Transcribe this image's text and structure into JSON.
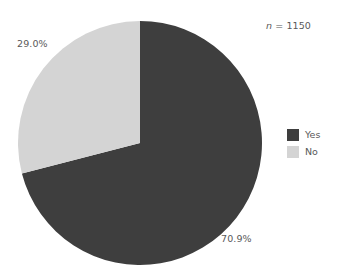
{
  "chart_data": {
    "type": "pie",
    "title": "",
    "categories": [
      "Yes",
      "No"
    ],
    "values": [
      70.9,
      29.0
    ],
    "value_labels": [
      "70.9%",
      "29.0%"
    ],
    "colors": [
      "#3e3e3e",
      "#d4d4d4"
    ],
    "legend": {
      "position": "right",
      "entries": [
        {
          "label": "Yes",
          "color": "#3e3e3e"
        },
        {
          "label": "No",
          "color": "#d4d4d4"
        }
      ]
    },
    "annotations": [
      {
        "name": "sample-size",
        "symbol": "n",
        "text": " = 1150",
        "value": 1150
      }
    ],
    "start_angle_deg": 0,
    "direction": "clockwise",
    "grid": false,
    "xlabel": "",
    "ylabel": ""
  },
  "figure": {
    "background": "#ffffff",
    "text_color": "#595959",
    "center_x": 140,
    "center_y": 143,
    "radius": 122
  },
  "labels": {
    "yes_pct": "70.9%",
    "no_pct": "29.0%"
  },
  "annotation": {
    "n_symbol": "n",
    "n_rest": " = 1150"
  },
  "legend": {
    "yes_label": "Yes",
    "no_label": "No"
  }
}
